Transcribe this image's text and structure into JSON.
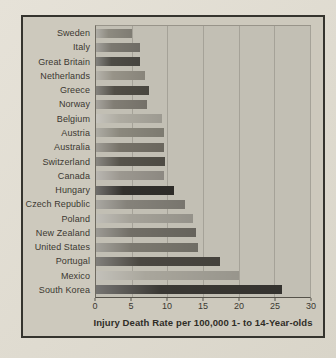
{
  "palette": {
    "page_bg": "#e1ddd2",
    "panel_bg": "#cdc9bd",
    "panel_border": "#35342e",
    "plot_bg": "#c2bfb4",
    "gridline": "#a5a298",
    "axis": "#55524a",
    "text": "#3b3831"
  },
  "chart_data": {
    "type": "bar",
    "orientation": "horizontal",
    "title": "",
    "xlabel": "Injury Death Rate per 100,000 1- to 14-Year-olds",
    "ylabel": "",
    "xlim": [
      0,
      30
    ],
    "xticks": [
      0,
      5,
      10,
      15,
      20,
      25,
      30
    ],
    "grid": true,
    "legend": false,
    "categories": [
      "Sweden",
      "Italy",
      "Great Britain",
      "Netherlands",
      "Greece",
      "Norway",
      "Belgium",
      "Austria",
      "Australia",
      "Switzerland",
      "Canada",
      "Hungary",
      "Czech Republic",
      "Poland",
      "New Zealand",
      "United States",
      "Portugal",
      "Mexico",
      "South Korea"
    ],
    "values": [
      5.1,
      6.1,
      6.1,
      6.8,
      7.4,
      7.1,
      9.2,
      9.5,
      9.5,
      9.7,
      9.6,
      11.0,
      12.5,
      13.6,
      14.0,
      14.3,
      17.4,
      20.0,
      26.1
    ],
    "bar_colors": [
      "#8d8a80",
      "#7b7870",
      "#4e4c46",
      "#979388",
      "#514e46",
      "#817d74",
      "#aeaba1",
      "#8b887d",
      "#767268",
      "#56534b",
      "#9c9890",
      "#32302c",
      "#85827a",
      "#a5a299",
      "#716e66",
      "#7c7970",
      "#4b4842",
      "#a9a69c",
      "#3a3834"
    ]
  }
}
